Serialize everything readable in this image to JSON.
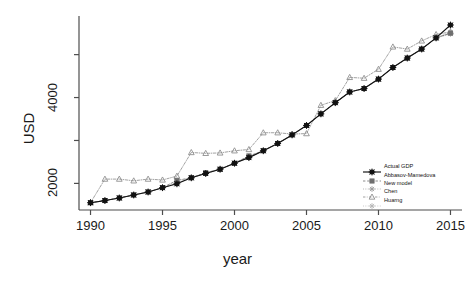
{
  "chart_data": {
    "type": "line",
    "title": "",
    "xlabel": "year",
    "ylabel": "USD",
    "xlim": [
      1989.2,
      2015.8
    ],
    "ylim": [
      1380,
      5900
    ],
    "grid": false,
    "legend_position": "bottom-right",
    "x": [
      1990,
      1991,
      1992,
      1993,
      1994,
      1995,
      1996,
      1997,
      1998,
      1999,
      2000,
      2001,
      2002,
      2003,
      2004,
      2005,
      2006,
      2007,
      2008,
      2009,
      2010,
      2011,
      2012,
      2013,
      2014,
      2015
    ],
    "xticks": [
      1990,
      1995,
      2000,
      2005,
      2010,
      2015
    ],
    "xtick_labels": [
      "1990",
      "1995",
      "2000",
      "2005",
      "2010",
      "2015"
    ],
    "yticks": [
      2000,
      3000,
      4000,
      5000
    ],
    "ytick_labels": [
      "2000",
      "",
      "4000",
      ""
    ],
    "series": [
      {
        "name": "Actual GDP",
        "color": "#111111",
        "linestyle": "solid",
        "marker": "asterisk-square",
        "values": [
          1550,
          1600,
          1660,
          1730,
          1800,
          1900,
          1990,
          2130,
          2230,
          2330,
          2470,
          2600,
          2760,
          2930,
          3130,
          3350,
          3620,
          3880,
          4130,
          4210,
          4430,
          4700,
          4920,
          5130,
          5390,
          5690
        ]
      },
      {
        "name": "Abbasov-Mamedova",
        "color": "#6f6f6f",
        "linestyle": "dashed",
        "marker": "square",
        "values": [
          1550,
          1600,
          1660,
          1730,
          1800,
          1900,
          2070,
          2130,
          2250,
          2330,
          2470,
          2640,
          2760,
          2930,
          3130,
          3350,
          3620,
          3880,
          4130,
          4210,
          4430,
          4700,
          4920,
          5130,
          5390,
          5500
        ]
      },
      {
        "name": "New model",
        "color": "#9a9a9a",
        "linestyle": "dotted",
        "marker": "plus",
        "values": [
          1550,
          1600,
          1660,
          1730,
          1800,
          1900,
          2000,
          2130,
          2230,
          2330,
          2470,
          2600,
          2760,
          2930,
          3130,
          3350,
          3620,
          3880,
          4130,
          4210,
          4430,
          4700,
          4920,
          5130,
          5390,
          5520
        ]
      },
      {
        "name": "Chen",
        "color": "#8a8a8a",
        "linestyle": "dashdot",
        "marker": "triangle",
        "values": [
          1550,
          2100,
          2100,
          2060,
          2100,
          2080,
          2170,
          2720,
          2700,
          2710,
          2760,
          2790,
          3180,
          3180,
          3150,
          3160,
          3820,
          3930,
          4470,
          4450,
          4660,
          5180,
          5130,
          5320,
          5470,
          5530
        ]
      },
      {
        "name": "Huarng",
        "color": "#b4b4b4",
        "linestyle": "dotted",
        "marker": "plus",
        "values": [
          1550,
          1600,
          1660,
          1730,
          1800,
          1900,
          2010,
          2130,
          2240,
          2330,
          2470,
          2620,
          2760,
          2930,
          3130,
          3350,
          3620,
          3880,
          4130,
          4210,
          4430,
          4700,
          4920,
          5130,
          5390,
          5480
        ]
      }
    ]
  }
}
